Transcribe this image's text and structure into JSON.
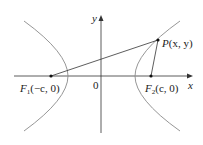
{
  "diagram": {
    "type": "hyperbola",
    "axes": {
      "x_label": "x",
      "y_label": "y",
      "origin_label": "0"
    },
    "foci": [
      {
        "name": "F1",
        "letter": "F",
        "subscript": "1",
        "coords": "(−c, 0)"
      },
      {
        "name": "F2",
        "letter": "F",
        "subscript": "2",
        "coords": "(c, 0)"
      }
    ],
    "point": {
      "letter": "P",
      "coords": "(x, y)"
    },
    "colors": {
      "curve": "#8a8a8a",
      "axis": "#333333",
      "line": "#333333"
    }
  }
}
